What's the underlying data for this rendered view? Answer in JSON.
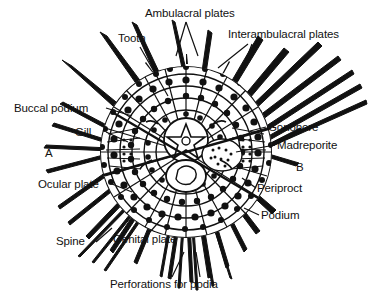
{
  "figure": {
    "kind": "scientific-line-diagram",
    "background_color": "#ffffff",
    "ink_color": "#111111"
  },
  "labels": [
    {
      "id": "ambulacral",
      "text": "Ambulacral plates"
    },
    {
      "id": "tooth",
      "text": "Tooth"
    },
    {
      "id": "interambu",
      "text": "Interambulacral plates"
    },
    {
      "id": "buccal",
      "text": "Buccal podium"
    },
    {
      "id": "gill",
      "text": "Gill"
    },
    {
      "id": "a",
      "text": "A"
    },
    {
      "id": "gonopore",
      "text": "Gonopore"
    },
    {
      "id": "madreporite",
      "text": "Madreporite"
    },
    {
      "id": "b",
      "text": "B"
    },
    {
      "id": "ocular",
      "text": "Ocular plate"
    },
    {
      "id": "periproct",
      "text": "Periproct"
    },
    {
      "id": "podium",
      "text": "Podium"
    },
    {
      "id": "spine",
      "text": "Spine"
    },
    {
      "id": "genital",
      "text": "Genital plate"
    },
    {
      "id": "perforations",
      "text": "Perforations for podia"
    }
  ]
}
